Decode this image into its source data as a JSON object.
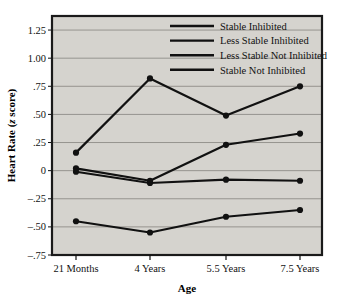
{
  "chart_data": {
    "type": "line",
    "title": "",
    "xlabel": "Age",
    "ylabel": "Heart Rate (z score)",
    "ylabel_plain": "Heart Rate (",
    "ylabel_italic": "z",
    "ylabel_tail": " score)",
    "categories": [
      "21 Months",
      "4 Years",
      "5.5 Years",
      "7.5 Years"
    ],
    "ylim": [
      -0.75,
      1.375
    ],
    "yticks": [
      1.25,
      1.0,
      0.75,
      0.5,
      0.25,
      0,
      -0.25,
      -0.5,
      -0.75
    ],
    "ytick_labels": [
      "1.25",
      "1.00",
      ".75",
      ".50",
      ".25",
      "0",
      "–.25",
      "–.50",
      "–.75"
    ],
    "grid": true,
    "grid_axis": "y",
    "legend_position": "top-right",
    "plot_bgcolor": "#d5d3ce",
    "line_color": "#111111",
    "marker": "circle",
    "series": [
      {
        "name": "Stable Inhibited",
        "values": [
          0.16,
          0.82,
          0.49,
          0.75
        ]
      },
      {
        "name": "Less Stable Inhibited",
        "values": [
          0.02,
          -0.09,
          0.23,
          0.33
        ]
      },
      {
        "name": "Less Stable Not Inhibited",
        "values": [
          -0.01,
          -0.11,
          -0.08,
          -0.09
        ]
      },
      {
        "name": "Stable Not Inhibited",
        "values": [
          -0.45,
          -0.55,
          -0.41,
          -0.35
        ]
      }
    ]
  },
  "legend": {
    "items": [
      {
        "label": "Stable Inhibited"
      },
      {
        "label": "Less Stable Inhibited"
      },
      {
        "label": "Less Stable Not Inhibited"
      },
      {
        "label": "Stable Not Inhibited"
      }
    ]
  },
  "axes": {
    "x_title": "Age",
    "y_title_pre": "Heart Rate (",
    "y_title_italic": "z",
    "y_title_post": " score)"
  }
}
